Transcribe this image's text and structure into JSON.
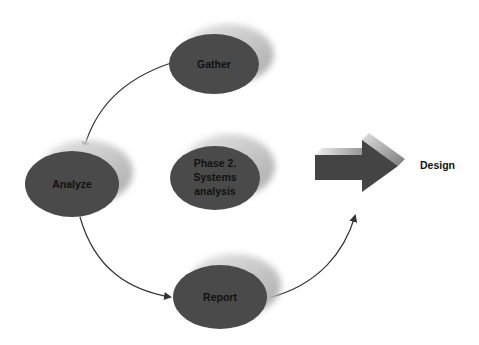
{
  "diagram": {
    "type": "cycle-flow",
    "colors": {
      "node_fill": "#4a4a4a",
      "node_shadow": "#c8c8c8",
      "connector": "#333333",
      "arrow_fill": "#444444",
      "label": "#111111"
    },
    "nodes": [
      {
        "id": "gather",
        "label": "Gather"
      },
      {
        "id": "analyze",
        "label": "Analyze"
      },
      {
        "id": "phase",
        "label_lines": [
          "Phase 2.",
          "Systems",
          "analysis"
        ]
      },
      {
        "id": "report",
        "label": "Report"
      }
    ],
    "edges": [
      {
        "from": "gather",
        "to": "analyze"
      },
      {
        "from": "analyze",
        "to": "report"
      },
      {
        "from": "report",
        "to": "design-arrow"
      }
    ],
    "output": {
      "arrow_icon": "right-block-arrow-icon",
      "label": "Design"
    }
  }
}
